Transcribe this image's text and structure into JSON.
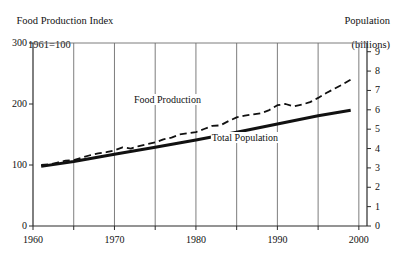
{
  "header": {
    "left_title_line1": "Food Production Index",
    "left_title_line2": "1961=100",
    "right_title_line1": "Population",
    "right_title_line2": "(billions)"
  },
  "chart_data": {
    "type": "line",
    "xlabel": "",
    "ylabel": "Food Production Index 1961=100",
    "y2label": "Population (billions)",
    "xlim": [
      1960,
      2001
    ],
    "ylim": [
      0,
      300
    ],
    "y2lim": [
      0,
      9.45
    ],
    "grid": "vertical",
    "legend": "inline-annotations",
    "xticks": [
      1960,
      1970,
      1980,
      1990,
      2000
    ],
    "xtick_labels": [
      "1960",
      "1970",
      "1980",
      "1990",
      "2000"
    ],
    "xminorticks": [
      1965,
      1975,
      1985,
      1995
    ],
    "gridlines": [
      1965,
      1970,
      1975,
      1980,
      1985,
      1990,
      1995,
      2000
    ],
    "yticks": [
      0,
      100,
      200,
      300
    ],
    "ytick_labels": [
      "0",
      "100",
      "200",
      "300"
    ],
    "y2ticks": [
      0,
      1,
      2,
      3,
      4,
      5,
      6,
      7,
      8,
      9
    ],
    "y2tick_labels": [
      "0",
      "1",
      "2",
      "3",
      "4",
      "5",
      "6",
      "7",
      "8",
      "9"
    ],
    "annotations": [
      {
        "text": "Food Production",
        "x": 1976.5,
        "y": 205
      },
      {
        "text": "Total Population",
        "x": 1986.0,
        "y": 143
      }
    ],
    "series": [
      {
        "name": "Food Production",
        "label": "Food Production",
        "axis": "left",
        "style": "dashed",
        "color": "#111111",
        "linewidth": 1.8,
        "x": [
          1961,
          1962,
          1963,
          1964,
          1965,
          1966,
          1967,
          1968,
          1969,
          1970,
          1971,
          1972,
          1973,
          1974,
          1975,
          1976,
          1977,
          1978,
          1979,
          1980,
          1981,
          1982,
          1983,
          1984,
          1985,
          1986,
          1987,
          1988,
          1989,
          1990,
          1991,
          1992,
          1993,
          1994,
          1995,
          1996,
          1997,
          1998,
          1999
        ],
        "values": [
          100,
          101,
          104,
          107,
          108,
          112,
          116,
          119,
          121,
          124,
          129,
          127,
          131,
          134,
          137,
          142,
          145,
          150,
          152,
          154,
          159,
          164,
          165,
          172,
          178,
          181,
          183,
          185,
          190,
          198,
          200,
          196,
          199,
          203,
          210,
          218,
          225,
          232,
          240
        ]
      },
      {
        "name": "Total Population",
        "label": "Total Population",
        "axis": "right",
        "style": "solid",
        "color": "#111111",
        "linewidth": 3.0,
        "x": [
          1961,
          1965,
          1970,
          1975,
          1980,
          1985,
          1990,
          1995,
          1999
        ],
        "values": [
          3.08,
          3.33,
          3.7,
          4.07,
          4.44,
          4.84,
          5.27,
          5.69,
          5.98
        ],
        "units": "billions"
      }
    ]
  },
  "plot_geometry": {
    "left": 33,
    "right": 367,
    "top": 43,
    "bottom": 226
  }
}
